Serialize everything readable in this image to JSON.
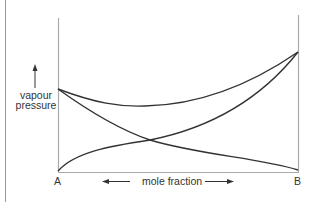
{
  "diagram": {
    "title": "",
    "y_axis_label_line1": "vapour",
    "y_axis_label_line2": "pressure",
    "x_axis_label": "mole fraction",
    "left_end_label": "A",
    "right_end_label": "B",
    "curves": [
      {
        "name": "total vapour pressure",
        "description": "positive deviation, dips to minimum near middle"
      },
      {
        "name": "partial pressure A",
        "description": "decreasing from A to B"
      },
      {
        "name": "partial pressure B",
        "description": "increasing from A to B"
      }
    ],
    "colors": {
      "curve": "#333333",
      "axis": "#aaaaaa",
      "text": "#333333"
    }
  }
}
